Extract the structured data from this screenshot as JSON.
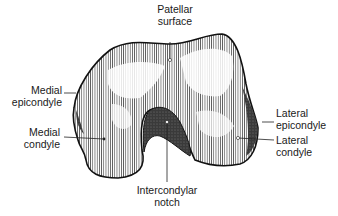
{
  "labels": {
    "patellar_surface": [
      "Patellar",
      "surface"
    ],
    "medial_epicondyle": [
      "Medial",
      "epicondyle"
    ],
    "medial_condyle": [
      "Medial",
      "condyle"
    ],
    "lateral_epicondyle": [
      "Lateral",
      "epicondyle"
    ],
    "lateral_condyle": [
      "Lateral",
      "condyle"
    ],
    "intercondylar_notch": [
      "Intercondylar",
      "notch"
    ]
  },
  "colors": {
    "ink": "#1a1a1a",
    "paper": "#ffffff",
    "shade": "#555555"
  }
}
